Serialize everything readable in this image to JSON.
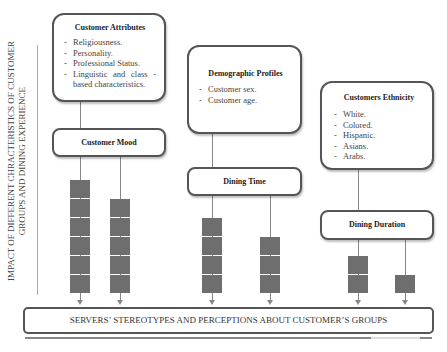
{
  "side_label": {
    "line1": "IMPACT OF DIFFERENT CHRACTERISTICS OF CUSTOMER",
    "line2": "GROUPS AND DINING EXPERIENCE"
  },
  "boxes": {
    "customer_attributes": {
      "title": "Customer Attributes",
      "items": [
        "Religiousness.",
        "Personality.",
        "Professional Status.",
        "Linguistic and class - based characteristics."
      ]
    },
    "customer_mood": {
      "title": "Customer Mood"
    },
    "demographic_profiles": {
      "title": "Demographic Profiles",
      "items": [
        "Customer sex.",
        "Customer age."
      ]
    },
    "dining_time": {
      "title": "Dining Time"
    },
    "customers_ethnicity": {
      "title": "Customers Ethnicity",
      "items": [
        "White.",
        "Colored.",
        "Hispanic.",
        "Asians.",
        "Arabs."
      ]
    },
    "dining_duration": {
      "title": "Dining Duration"
    }
  },
  "columns": [
    {
      "name": "attributes-column",
      "squares": 6
    },
    {
      "name": "mood-column",
      "squares": 5
    },
    {
      "name": "demographic-column",
      "squares": 4
    },
    {
      "name": "dining-time-column",
      "squares": 3
    },
    {
      "name": "ethnicity-column",
      "squares": 2
    },
    {
      "name": "dining-duration-column",
      "squares": 1
    }
  ],
  "bottom": {
    "label": "SERVERS’ STEREOTYPES AND PERCEPTIONS ABOUT CUSTOMER’S GROUPS"
  }
}
